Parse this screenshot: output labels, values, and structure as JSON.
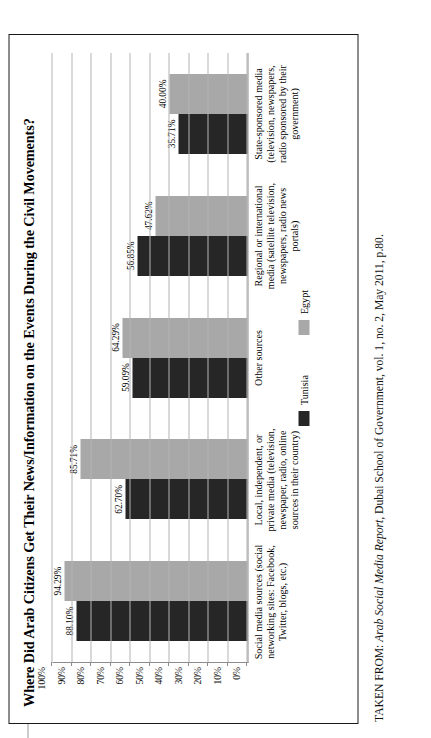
{
  "figure": {
    "title": "Where Did Arab Citizens Get Their News/Information on the Events During the Civil Movements?",
    "source_prefix": "TAKEN FROM: ",
    "source_italic": "Arab Social Media Report",
    "source_rest": ", Dubai School of Government, vol. 1, no. 2, May 2011, p.80."
  },
  "chart_data": {
    "type": "bar",
    "title": "Where Did Arab Citizens Get Their News/Information on the Events During the Civil Movements?",
    "xlabel": "",
    "ylabel": "",
    "ylim": [
      0,
      100
    ],
    "grid": true,
    "legend_position": "bottom",
    "orientation": "vertical-grouped",
    "categories": [
      "Social media sources (social networking sites: Facebook, Twitter, blogs, etc.)",
      "Local, independent, or private media (television, newspaper, radio, online sources in their country)",
      "Other sources",
      "Regional or international media (satellite television, newspapers, radio news portals)",
      "State-sponsored media (television, newspapers, radio sponsored by their government)"
    ],
    "series": [
      {
        "name": "Tunisia",
        "color": "#262626",
        "values": [
          88.1,
          62.7,
          59.09,
          56.85,
          35.71
        ]
      },
      {
        "name": "Egypt",
        "color": "#a8a8a8",
        "values": [
          94.29,
          85.71,
          64.29,
          47.62,
          40.0
        ]
      }
    ],
    "data_labels": {
      "Tunisia": [
        "88.10%",
        "62.70%",
        "59.09%",
        "56.85%",
        "35.71%"
      ],
      "Egypt": [
        "94.29%",
        "85.71%",
        "64.29%",
        "47.62%",
        "40.00%"
      ]
    },
    "yticks": [
      100,
      90,
      80,
      70,
      60,
      50,
      40,
      30,
      20,
      10,
      0
    ],
    "ytick_labels": [
      "100%",
      "90%",
      "80%",
      "70%",
      "60%",
      "50%",
      "40%",
      "30%",
      "20%",
      "10%",
      "0%"
    ]
  },
  "legend": {
    "items": [
      {
        "label": "Tunisia",
        "color": "#262626"
      },
      {
        "label": "Egypt",
        "color": "#a8a8a8"
      }
    ]
  }
}
